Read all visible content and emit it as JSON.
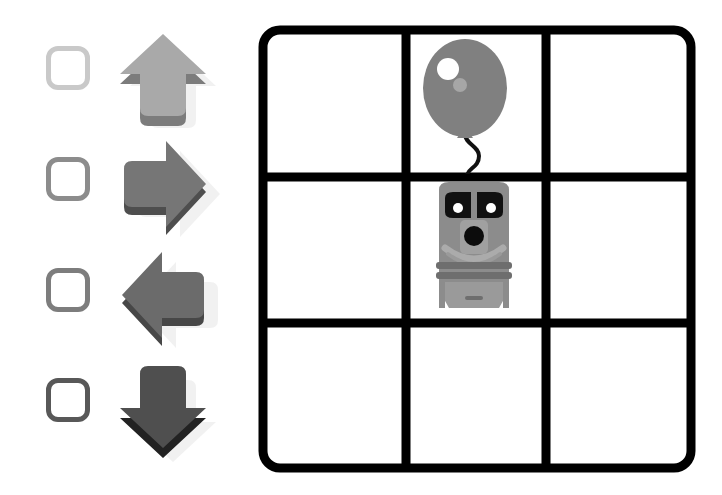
{
  "page": {
    "width": 722,
    "height": 495,
    "background": "#ffffff"
  },
  "palette": {
    "grid_line": "#000000",
    "cell_fill": "#ffffff",
    "shadow": "#d8d8d8",
    "balloon_body": "#808080",
    "balloon_highlight": "#ffffff",
    "balloon_highlight_2": "#a6a6a6",
    "balloon_string": "#111111",
    "train_body": "#8c8c8c",
    "train_body_light": "#a8a8a8",
    "train_window": "#111111",
    "train_headlight": "#000000",
    "train_dark_trim": "#6e6e6e"
  },
  "options": {
    "label": "direction-options",
    "items": [
      {
        "id": "option-up",
        "direction": "up",
        "icon": "arrow-up-icon",
        "checkbox_name": "checkbox-up",
        "checked": false,
        "checkbox_border": "#c9c9c9",
        "arrow_top": "#a9a9a9",
        "arrow_side": "#7c7c7c",
        "arrow_shadow": "#d9d9d9",
        "row_top": 28
      },
      {
        "id": "option-right",
        "direction": "right",
        "icon": "arrow-right-icon",
        "checkbox_name": "checkbox-right",
        "checked": false,
        "checkbox_border": "#8c8c8c",
        "arrow_top": "#767676",
        "arrow_side": "#4e4e4e",
        "arrow_shadow": "#d3d3d3",
        "row_top": 139
      },
      {
        "id": "option-left",
        "direction": "left",
        "icon": "arrow-left-icon",
        "checkbox_name": "checkbox-left",
        "checked": false,
        "checkbox_border": "#7d7d7d",
        "arrow_top": "#6b6b6b",
        "arrow_side": "#474747",
        "arrow_shadow": "#d3d3d3",
        "row_top": 250
      },
      {
        "id": "option-down",
        "direction": "down",
        "icon": "arrow-down-icon",
        "checkbox_name": "checkbox-down",
        "checked": false,
        "checkbox_border": "#585858",
        "arrow_top": "#4f4f4f",
        "arrow_side": "#222222",
        "arrow_shadow": "#d3d3d3",
        "row_top": 360
      }
    ]
  },
  "grid": {
    "name": "puzzle-grid",
    "rows": 3,
    "cols": 3,
    "line_width": 9,
    "corner_radius": 16,
    "cells": [
      {
        "row": 0,
        "col": 0,
        "content": "empty"
      },
      {
        "row": 0,
        "col": 1,
        "content": "balloon"
      },
      {
        "row": 0,
        "col": 2,
        "content": "empty"
      },
      {
        "row": 1,
        "col": 0,
        "content": "empty"
      },
      {
        "row": 1,
        "col": 1,
        "content": "train"
      },
      {
        "row": 1,
        "col": 2,
        "content": "empty"
      },
      {
        "row": 2,
        "col": 0,
        "content": "empty"
      },
      {
        "row": 2,
        "col": 1,
        "content": "empty"
      },
      {
        "row": 2,
        "col": 2,
        "content": "empty"
      }
    ]
  },
  "objects": {
    "balloon": {
      "name": "balloon-icon",
      "cell": "row0-col1"
    },
    "train": {
      "name": "train-icon",
      "cell": "row1-col1"
    }
  }
}
